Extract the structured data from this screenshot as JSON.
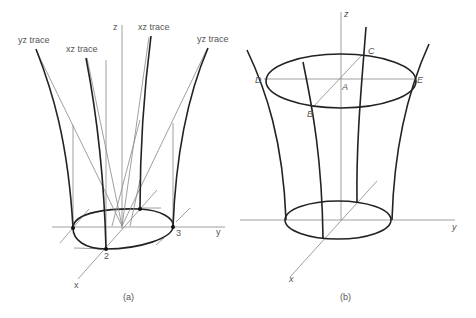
{
  "panel_a": {
    "caption": "(a)",
    "axis_labels": {
      "z": "z",
      "y": "y",
      "x": "x"
    },
    "trace_labels": {
      "yz_left": "yz trace",
      "xz_left": "xz trace",
      "xz_right": "xz trace",
      "yz_right": "yz trace"
    },
    "point_labels": {
      "p2": "2",
      "p3": "3"
    }
  },
  "panel_b": {
    "caption": "(b)",
    "axis_labels": {
      "z": "z",
      "y": "y",
      "x": "x"
    },
    "point_labels": {
      "A": "A",
      "B": "B",
      "C": "C",
      "D": "D",
      "E": "E"
    }
  }
}
